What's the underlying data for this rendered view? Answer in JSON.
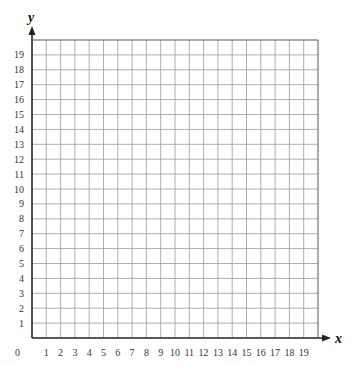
{
  "chart_data": {
    "type": "scatter",
    "title": "",
    "xlabel": "x",
    "ylabel": "y",
    "xlim": [
      0,
      20
    ],
    "ylim": [
      0,
      20
    ],
    "grid": true,
    "origin_label": "0",
    "x_ticks": [
      "1",
      "2",
      "3",
      "4",
      "5",
      "6",
      "7",
      "8",
      "9",
      "10",
      "11",
      "12",
      "13",
      "14",
      "15",
      "16",
      "17",
      "18",
      "19"
    ],
    "y_ticks": [
      "1",
      "2",
      "3",
      "4",
      "5",
      "6",
      "7",
      "8",
      "9",
      "10",
      "11",
      "12",
      "13",
      "14",
      "15",
      "16",
      "17",
      "18",
      "19"
    ],
    "series": [],
    "legend": null
  },
  "colors": {
    "grid": "#9a9a9a",
    "axis": "#222222",
    "text": "#333333"
  }
}
